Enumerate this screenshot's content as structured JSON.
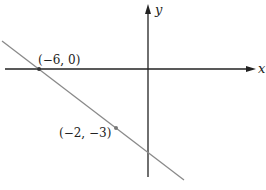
{
  "diagram": {
    "type": "coordinate-plane-line",
    "axes": {
      "x_label": "x",
      "y_label": "y"
    },
    "line": {
      "color": "#8a8a8a",
      "description": "Line with negative slope passing through two labeled points"
    },
    "points": [
      {
        "label": "(−6, 0)",
        "x": -6,
        "y": 0
      },
      {
        "label": "(−2, −3)",
        "x": -2,
        "y": -3
      }
    ],
    "colors": {
      "axes": "#222222",
      "line": "#8a8a8a",
      "point": "#555555"
    }
  }
}
